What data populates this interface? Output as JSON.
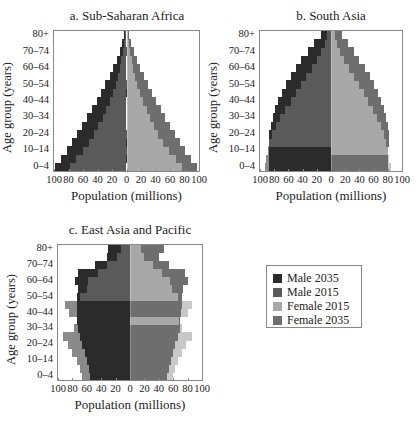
{
  "figure": {
    "legend": [
      {
        "label": "Male 2035",
        "color": "#2b2b2b",
        "key": "male2035"
      },
      {
        "label": "Male 2015",
        "color": "#5a5a5a",
        "key": "male2015"
      },
      {
        "label": "Female 2015",
        "color": "#a8a8a8",
        "key": "female2015"
      },
      {
        "label": "Female 2035",
        "color": "#6e6e6e",
        "key": "female2035"
      }
    ],
    "y_tick_labels": [
      "80+",
      "70–74",
      "60–64",
      "50–54",
      "40–44",
      "30–34",
      "20–24",
      "10–14",
      "0–4"
    ],
    "x_tick_labels": [
      "100",
      "80",
      "60",
      "40",
      "20",
      "0",
      "20",
      "40",
      "60",
      "80",
      "100"
    ],
    "ylabel": "Age group (years)",
    "xlabel": "Population (millions)",
    "panel_titles": [
      "a. Sub-Saharan Africa",
      "b. South Asia",
      "c. East Asia and Pacific"
    ]
  },
  "chart_data": [
    {
      "type": "bar",
      "orientation": "horizontal-pyramid",
      "title": "a. Sub-Saharan Africa",
      "xlabel": "Population (millions)",
      "ylabel": "Age group (years)",
      "xlim": [
        -100,
        100
      ],
      "categories": [
        "0–4",
        "5–9",
        "10–14",
        "15–19",
        "20–24",
        "25–29",
        "30–34",
        "35–39",
        "40–44",
        "45–49",
        "50–54",
        "55–59",
        "60–64",
        "65–69",
        "70–74",
        "75–79",
        "80+"
      ],
      "series": [
        {
          "name": "Male 2035",
          "values": [
            98,
            90,
            82,
            75,
            68,
            61,
            54,
            47,
            41,
            35,
            29,
            23,
            18,
            13,
            9,
            6,
            3
          ]
        },
        {
          "name": "Male 2015",
          "values": [
            78,
            69,
            60,
            52,
            45,
            39,
            33,
            28,
            23,
            19,
            15,
            12,
            9,
            7,
            5,
            3,
            2
          ]
        },
        {
          "name": "Female 2015",
          "values": [
            77,
            68,
            59,
            51,
            44,
            38,
            33,
            28,
            23,
            19,
            15,
            12,
            9,
            7,
            5,
            3,
            2
          ]
        },
        {
          "name": "Female 2035",
          "values": [
            97,
            89,
            81,
            74,
            67,
            60,
            53,
            47,
            41,
            35,
            29,
            24,
            19,
            14,
            10,
            6,
            3
          ]
        }
      ],
      "legend_position": "right-bottom panel",
      "grid": false
    },
    {
      "type": "bar",
      "orientation": "horizontal-pyramid",
      "title": "b. South Asia",
      "xlabel": "Population (millions)",
      "ylabel": "Age group (years)",
      "xlim": [
        -100,
        100
      ],
      "categories": [
        "0–4",
        "5–9",
        "10–14",
        "15–19",
        "20–24",
        "25–29",
        "30–34",
        "35–39",
        "40–44",
        "45–49",
        "50–54",
        "55–59",
        "60–64",
        "65–69",
        "70–74",
        "75–79",
        "80+"
      ],
      "series": [
        {
          "name": "Male 2035",
          "values": [
            88,
            88,
            88,
            88,
            87,
            85,
            82,
            79,
            74,
            69,
            63,
            57,
            50,
            42,
            33,
            24,
            14
          ]
        },
        {
          "name": "Male 2015",
          "values": [
            93,
            91,
            89,
            87,
            83,
            78,
            72,
            65,
            57,
            50,
            42,
            35,
            27,
            20,
            14,
            9,
            5
          ]
        },
        {
          "name": "Female 2015",
          "values": [
            84,
            82,
            80,
            78,
            75,
            70,
            65,
            59,
            52,
            46,
            39,
            32,
            25,
            18,
            13,
            8,
            5
          ]
        },
        {
          "name": "Female 2035",
          "values": [
            80,
            80,
            80,
            81,
            82,
            80,
            78,
            75,
            71,
            66,
            61,
            55,
            48,
            40,
            32,
            24,
            16
          ]
        }
      ],
      "legend_position": "right-bottom panel",
      "grid": false
    },
    {
      "type": "bar",
      "orientation": "horizontal-pyramid",
      "title": "c. East Asia and Pacific",
      "xlabel": "Population (millions)",
      "ylabel": "Age group (years)",
      "xlim": [
        -100,
        100
      ],
      "categories": [
        "0–4",
        "5–9",
        "10–14",
        "15–19",
        "20–24",
        "25–29",
        "30–34",
        "35–39",
        "40–44",
        "45–49",
        "50–54",
        "55–59",
        "60–64",
        "65–69",
        "70–74",
        "75–79",
        "80+"
      ],
      "series": [
        {
          "name": "Male 2035",
          "values": [
            55,
            57,
            60,
            63,
            66,
            69,
            72,
            73,
            74,
            74,
            73,
            72,
            77,
            72,
            48,
            32,
            30
          ]
        },
        {
          "name": "Male 2015",
          "values": [
            67,
            70,
            74,
            81,
            86,
            93,
            78,
            74,
            85,
            90,
            70,
            60,
            58,
            45,
            32,
            18,
            12
          ]
        },
        {
          "name": "Female 2015",
          "values": [
            60,
            62,
            66,
            72,
            78,
            86,
            72,
            68,
            81,
            86,
            67,
            58,
            56,
            45,
            32,
            20,
            15
          ]
        },
        {
          "name": "Female 2035",
          "values": [
            52,
            54,
            57,
            60,
            63,
            66,
            69,
            70,
            71,
            72,
            72,
            73,
            80,
            76,
            54,
            40,
            47
          ]
        }
      ],
      "legend_position": "right of panel",
      "grid": false
    }
  ]
}
